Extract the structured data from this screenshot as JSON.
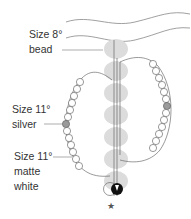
{
  "diagram": {
    "type": "beading-pattern",
    "labels": {
      "size8_line1": "Size 8°",
      "size8_line2": "bead",
      "silver_line1": "Size 11°",
      "silver_line2": "silver",
      "matte_line1": "Size 11°",
      "matte_line2": "matte",
      "matte_line3": "white"
    },
    "start_marker": "★",
    "colors": {
      "thread": "#555555",
      "size8_bead": "#d9d9d9",
      "size11_matte": "#ffffff",
      "size11_silver": "#9a9a9a",
      "focal_bead": "#111111",
      "label_text": "#333333"
    }
  }
}
